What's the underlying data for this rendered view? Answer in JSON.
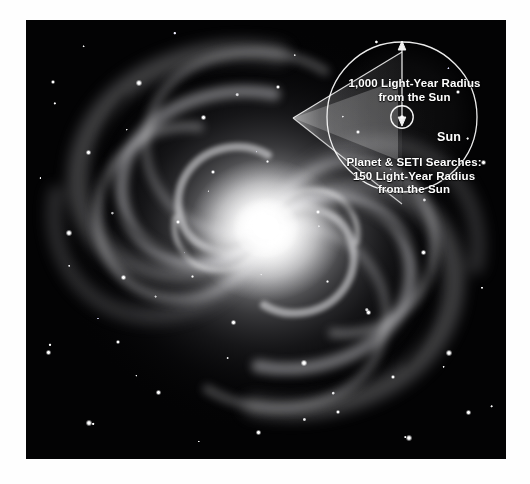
{
  "figure": {
    "type": "astronomy-illustration",
    "background_color": "#ffffff",
    "photo_color": "#000000",
    "overlay_color": "#ffffff"
  },
  "inset": {
    "outer_circle_label": "1,000 Light-Year Radius\nfrom the Sun",
    "inner_circle_label": "Planet & SETI Searches:\n150 Light-Year Radius\nfrom the Sun",
    "sun_label": "Sun",
    "radius_arrow_name": "radius-arrow",
    "magnifier_cone_name": "magnifier-cone"
  },
  "annotations": {
    "outer_radius_value": "1,000",
    "outer_radius_unit": "Light-Year Radius",
    "inner_radius_value": "150",
    "inner_radius_unit": "Light-Year Radius",
    "reference_point": "from the Sun",
    "search_programs": "Planet & SETI Searches:"
  }
}
